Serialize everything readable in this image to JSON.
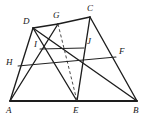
{
  "figure": {
    "background_color": "#ffffff",
    "stroke_color": "#1d1d1d",
    "dashed_stroke_color": "#4a4a4a",
    "width": 146,
    "height": 125,
    "points": {
      "A": {
        "label": "A",
        "x": 10,
        "y": 101,
        "label_x": 6,
        "label_y": 106
      },
      "B": {
        "label": "B",
        "x": 137,
        "y": 101,
        "label_x": 133,
        "label_y": 106
      },
      "C": {
        "label": "C",
        "x": 90,
        "y": 17,
        "label_x": 87,
        "label_y": 4
      },
      "D": {
        "label": "D",
        "x": 33,
        "y": 28,
        "label_x": 23,
        "label_y": 17
      },
      "E": {
        "label": "E",
        "x": 77,
        "y": 101,
        "label_x": 73,
        "label_y": 106
      },
      "F": {
        "label": "F",
        "x": 116,
        "y": 57,
        "label_x": 119,
        "label_y": 47
      },
      "G": {
        "label": "G",
        "x": 58,
        "y": 24,
        "label_x": 53,
        "label_y": 11
      },
      "H": {
        "label": "H",
        "x": 18,
        "y": 66,
        "label_x": 6,
        "label_y": 58
      },
      "I": {
        "label": "I",
        "x": 40,
        "y": 49,
        "label_x": 34,
        "label_y": 40
      },
      "J": {
        "label": "J",
        "x": 84,
        "y": 48,
        "label_x": 87,
        "label_y": 37
      }
    },
    "segments": [
      {
        "name": "segment-AB",
        "from": "A",
        "to": "B",
        "style": "base"
      },
      {
        "name": "segment-AD",
        "from": "A",
        "to": "D",
        "style": "solid"
      },
      {
        "name": "segment-DG",
        "from": "D",
        "to": "G",
        "style": "solid"
      },
      {
        "name": "segment-GC",
        "from": "G",
        "to": "C",
        "style": "solid"
      },
      {
        "name": "segment-CB",
        "from": "C",
        "to": "B",
        "style": "solid"
      },
      {
        "name": "segment-AG",
        "from": "A",
        "to": "G",
        "style": "solid"
      },
      {
        "name": "segment-DB",
        "from": "D",
        "to": "B",
        "style": "solid"
      },
      {
        "name": "segment-DE",
        "from": "D",
        "to": "E",
        "style": "solid"
      },
      {
        "name": "segment-CE",
        "from": "C",
        "to": "E",
        "style": "solid"
      },
      {
        "name": "segment-GE",
        "from": "G",
        "to": "E",
        "style": "dashed"
      },
      {
        "name": "segment-IJ",
        "from": "I",
        "to": "J",
        "style": "thin"
      },
      {
        "name": "segment-HF",
        "from": "H",
        "to": "F",
        "style": "thin"
      }
    ]
  }
}
